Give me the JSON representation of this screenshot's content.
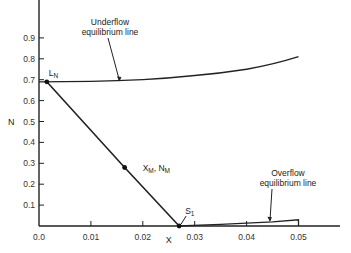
{
  "chart_data": {
    "type": "line",
    "title": "",
    "xlabel": "X",
    "ylabel": "N",
    "xlim": [
      0.0,
      0.055
    ],
    "ylim": [
      0.0,
      1.0
    ],
    "grid": false,
    "x_ticks": [
      0.0,
      0.01,
      0.02,
      0.03,
      0.04,
      0.05
    ],
    "x_tick_labels": [
      "0.0",
      "0.01",
      "0.02",
      "0.03",
      "0.04",
      "0.05"
    ],
    "y_ticks": [
      0.1,
      0.2,
      0.3,
      0.4,
      0.5,
      0.6,
      0.7,
      0.8,
      0.9
    ],
    "y_tick_labels": [
      "0.1",
      "0.2",
      "0.3",
      "0.4",
      "0.5",
      "0.6",
      "0.7",
      "0.8",
      "0.9"
    ],
    "series": [
      {
        "name": "Underflow equilibrium line",
        "x": [
          0.0,
          0.01,
          0.02,
          0.03,
          0.04,
          0.05
        ],
        "y": [
          0.69,
          0.692,
          0.7,
          0.72,
          0.75,
          0.81
        ]
      },
      {
        "name": "Overflow equilibrium line",
        "x": [
          0.027,
          0.035,
          0.045,
          0.05,
          0.05
        ],
        "y": [
          0.0,
          0.008,
          0.02,
          0.03,
          0.0
        ]
      },
      {
        "name": "Operating line",
        "x": [
          0.0015,
          0.0165,
          0.027
        ],
        "y": [
          0.69,
          0.28,
          0.0
        ]
      }
    ],
    "points": [
      {
        "label": "L_N",
        "main": "L",
        "sub": "N",
        "x": 0.0015,
        "y": 0.69
      },
      {
        "label": "X_M, N_M",
        "main": "X",
        "sub": "M",
        "main2": "N",
        "sub2": "M",
        "x": 0.0165,
        "y": 0.28
      },
      {
        "label": "S_1",
        "main": "S",
        "sub": "1",
        "x": 0.027,
        "y": 0.0
      }
    ],
    "annotations": [
      {
        "lines": [
          "Underflow",
          "equilibrium line"
        ],
        "arrow_to": {
          "x": 0.0155,
          "y": 0.691
        }
      },
      {
        "lines": [
          "Overflow",
          "equilibrium line"
        ],
        "arrow_to": {
          "x": 0.0445,
          "y": 0.02
        }
      }
    ]
  }
}
